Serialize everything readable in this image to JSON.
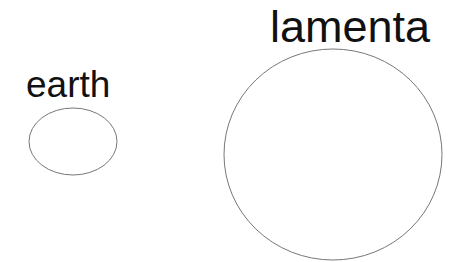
{
  "diagram": {
    "shapes": [
      {
        "id": "earth",
        "label": "earth",
        "shape": "ellipse",
        "cx": 73,
        "cy": 141.5,
        "rx": 44,
        "ry": 33.5,
        "stroke": "#777777"
      },
      {
        "id": "lamenta",
        "label": "lamenta",
        "shape": "ellipse",
        "cx": 333,
        "cy": 154.5,
        "rx": 109,
        "ry": 105.5,
        "stroke": "#777777"
      }
    ]
  }
}
